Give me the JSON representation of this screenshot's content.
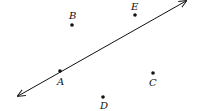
{
  "diagram": {
    "type": "geometry-points-and-line",
    "line": {
      "label": "line through A",
      "from": [
        18,
        96
      ],
      "to": [
        186,
        1
      ],
      "arrows": "both",
      "color": "#111111"
    },
    "points": [
      {
        "name": "A",
        "x": 60,
        "y": 71,
        "label_x": 57,
        "label_y": 85,
        "on_line": true
      },
      {
        "name": "B",
        "x": 72,
        "y": 25,
        "label_x": 69,
        "label_y": 19
      },
      {
        "name": "E",
        "x": 135,
        "y": 15,
        "label_x": 131,
        "label_y": 10
      },
      {
        "name": "C",
        "x": 153,
        "y": 73,
        "label_x": 149,
        "label_y": 86
      },
      {
        "name": "D",
        "x": 103,
        "y": 97,
        "label_x": 100,
        "label_y": 109
      }
    ]
  }
}
